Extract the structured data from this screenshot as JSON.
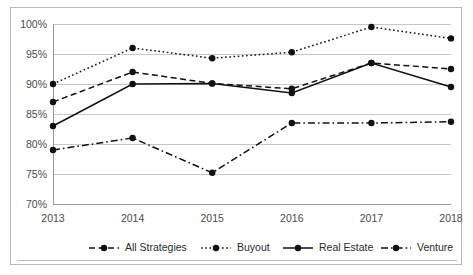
{
  "chart_data": {
    "type": "line",
    "title": "",
    "xlabel": "",
    "ylabel": "",
    "categories": [
      "2013",
      "2014",
      "2015",
      "2016",
      "2017",
      "2018"
    ],
    "x": [
      2013,
      2014,
      2015,
      2016,
      2017,
      2018
    ],
    "ylim": [
      70,
      100
    ],
    "ytick_values": [
      70,
      75,
      80,
      85,
      90,
      95,
      100
    ],
    "ytick_labels": [
      "70%",
      "75%",
      "80%",
      "85%",
      "90%",
      "95%",
      "100%"
    ],
    "grid": true,
    "legend_position": "bottom",
    "series": [
      {
        "name": "All Strategies",
        "dash": "dashed",
        "color": "#111111",
        "values": [
          87.0,
          92.0,
          90.1,
          89.2,
          93.5,
          92.5
        ]
      },
      {
        "name": "Buyout",
        "dash": "dotted",
        "color": "#111111",
        "values": [
          90.0,
          96.0,
          94.3,
          95.3,
          99.5,
          97.6
        ]
      },
      {
        "name": "Real Estate",
        "dash": "solid",
        "color": "#111111",
        "values": [
          83.0,
          90.0,
          90.1,
          88.5,
          93.5,
          89.5
        ]
      },
      {
        "name": "Venture",
        "dash": "dashdot",
        "color": "#111111",
        "values": [
          79.0,
          81.0,
          75.2,
          83.5,
          83.5,
          83.7
        ]
      }
    ]
  }
}
